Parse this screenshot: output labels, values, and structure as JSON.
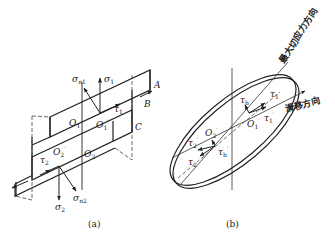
{
  "figure": {
    "panel_a": {
      "caption": "(a)",
      "labels": {
        "A": "A",
        "B": "B",
        "C": "C",
        "sigma_n1": "σ",
        "sigma_n1_sub": "n1",
        "sigma_1": "σ",
        "sigma_1_sub": "1",
        "tau_1": "τ",
        "tau_1_sub": "1",
        "O1": "O",
        "O1_sub": "1",
        "O1p": "O",
        "O1p_sub": "1",
        "O1p_prime": "′",
        "tau_2": "τ",
        "tau_2_sub": "2",
        "O2p": "O",
        "O2p_sub": "2",
        "O2p_prime": "′",
        "O2": "O",
        "O2_sub": "2",
        "sigma_2": "σ",
        "sigma_2_sub": "2",
        "sigma_n2": "σ",
        "sigma_n2_sub": "n2"
      }
    },
    "panel_b": {
      "caption": "(b)",
      "max_shear_direction": "最大切应力方向",
      "slip_direction": "滑移方向",
      "labels": {
        "tau_b": "τ",
        "tau_b_sub": "b",
        "tau_1": "τ",
        "tau_1_sub": "1",
        "tau_1p": "τ",
        "tau_1p_sub": "1",
        "tau_1p_prime": "′",
        "O1p": "O",
        "O1p_sub": "1",
        "O1p_prime": "′",
        "tau_2p": "τ",
        "tau_2p_sub": "2",
        "tau_2p_prime": "′",
        "O2p": "O",
        "O2p_sub": "2",
        "O2p_prime": "′",
        "tau_bp": "τ",
        "tau_bp_sub": "b",
        "tau_bp_prime": "′",
        "tau_2": "τ",
        "tau_2_sub": "2"
      }
    }
  }
}
